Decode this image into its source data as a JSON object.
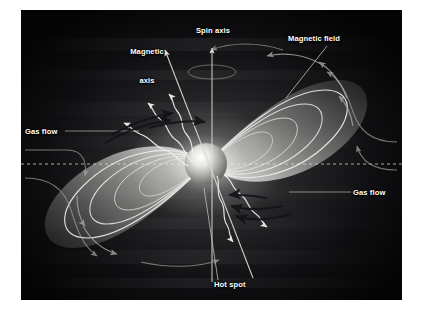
{
  "figure": {
    "kind": "astronomy-diagram",
    "background_color": "#050507",
    "frame_color": "#ffffff",
    "label_color": "#ffffff"
  },
  "labels": {
    "magnetic_axis": "Magnetic\naxis",
    "magnetic_axis_line1": "Magnetic",
    "magnetic_axis_line2": "axis",
    "spin_axis": "Spin axis",
    "magnetic_field": "Magnetic field",
    "gas_flow_left": "Gas flow",
    "gas_flow_right": "Gas flow",
    "hot_spot": "Hot spot"
  },
  "elements": {
    "star": {
      "name": "central compact star",
      "cx": 185,
      "cy": 154,
      "r": 21
    },
    "spin_axis": {
      "name": "spin axis",
      "x": 191,
      "top": 36,
      "bottom": 272,
      "arrow": "up"
    },
    "magnetic_axis": {
      "name": "magnetic axis",
      "tilt_deg": 22,
      "arrow": "up-left"
    },
    "field_loops_upper_right": 4,
    "field_loops_lower_left": 4,
    "radiation_beams_upper": 3,
    "radiation_beams_lower": 2,
    "accretion_plane": {
      "name": "dashed disk plane",
      "y": 154,
      "style": "dashed"
    },
    "gas_flow_arrows_upper_left": 3,
    "gas_flow_arrows_lower_right": 3,
    "field_direction_arrows": 5,
    "rotation_ellipse": {
      "cx": 191,
      "cy": 62
    }
  },
  "colors": {
    "beam_white": "#f2f2ef",
    "loop_white": "#e8e8e4",
    "dark_arrow": "#15171c",
    "grey_arrow": "#9b9b97",
    "dashed_line": "#b9b9b4"
  }
}
